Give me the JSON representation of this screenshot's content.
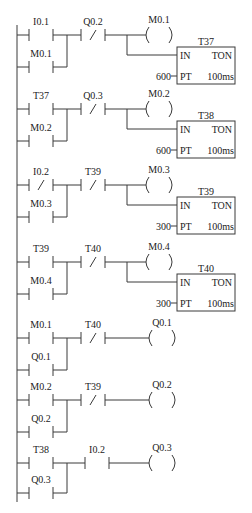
{
  "diagram": {
    "type": "plc-ladder-diagram",
    "rail": {
      "x": 17,
      "y_top": 25,
      "y_bottom": 502
    },
    "rungs": [
      {
        "id": 1,
        "y": 35,
        "contacts": [
          {
            "label": "I0.1",
            "type": "NO",
            "x": 29,
            "branch": "main"
          },
          {
            "label": "M0.1",
            "type": "NO",
            "x": 29,
            "branch": "parallel",
            "y": 67
          },
          {
            "label": "Q0.2",
            "type": "NC",
            "x": 81
          }
        ],
        "coil": {
          "label": "M0.1",
          "x": 145
        },
        "timer": {
          "name": "T37",
          "in": "IN",
          "type": "TON",
          "pt_label": "PT",
          "pt_value": "600",
          "base": "100ms",
          "y": 47
        }
      },
      {
        "id": 2,
        "y": 109,
        "contacts": [
          {
            "label": "T37",
            "type": "NO",
            "x": 29,
            "branch": "main"
          },
          {
            "label": "M0.2",
            "type": "NO",
            "x": 29,
            "branch": "parallel",
            "y": 141
          },
          {
            "label": "Q0.3",
            "type": "NC",
            "x": 81
          }
        ],
        "coil": {
          "label": "M0.2",
          "x": 145
        },
        "timer": {
          "name": "T38",
          "in": "IN",
          "type": "TON",
          "pt_label": "PT",
          "pt_value": "600",
          "base": "100ms",
          "y": 121
        }
      },
      {
        "id": 3,
        "y": 185,
        "contacts": [
          {
            "label": "I0.2",
            "type": "NC",
            "x": 29,
            "branch": "main"
          },
          {
            "label": "M0.3",
            "type": "NO",
            "x": 29,
            "branch": "parallel",
            "y": 217
          },
          {
            "label": "T39",
            "type": "NC",
            "x": 81
          }
        ],
        "coil": {
          "label": "M0.3",
          "x": 145
        },
        "timer": {
          "name": "T39",
          "in": "IN",
          "type": "TON",
          "pt_label": "PT",
          "pt_value": "300",
          "base": "100ms",
          "y": 197
        }
      },
      {
        "id": 4,
        "y": 262,
        "contacts": [
          {
            "label": "T39",
            "type": "NO",
            "x": 29,
            "branch": "main"
          },
          {
            "label": "M0.4",
            "type": "NO",
            "x": 29,
            "branch": "parallel",
            "y": 294
          },
          {
            "label": "T40",
            "type": "NC",
            "x": 81
          }
        ],
        "coil": {
          "label": "M0.4",
          "x": 145
        },
        "timer": {
          "name": "T40",
          "in": "IN",
          "type": "TON",
          "pt_label": "PT",
          "pt_value": "300",
          "base": "100ms",
          "y": 274
        }
      },
      {
        "id": 5,
        "y": 338,
        "contacts": [
          {
            "label": "M0.1",
            "type": "NO",
            "x": 29,
            "branch": "main"
          },
          {
            "label": "Q0.1",
            "type": "NO",
            "x": 29,
            "branch": "parallel",
            "y": 370
          },
          {
            "label": "T40",
            "type": "NC",
            "x": 81
          }
        ],
        "coil": {
          "label": "Q0.1",
          "x": 148
        }
      },
      {
        "id": 6,
        "y": 400,
        "contacts": [
          {
            "label": "M0.2",
            "type": "NO",
            "x": 29,
            "branch": "main"
          },
          {
            "label": "Q0.2",
            "type": "NO",
            "x": 29,
            "branch": "parallel",
            "y": 432
          },
          {
            "label": "T39",
            "type": "NC",
            "x": 81
          }
        ],
        "coil": {
          "label": "Q0.2",
          "x": 148
        }
      },
      {
        "id": 7,
        "y": 463,
        "contacts": [
          {
            "label": "T38",
            "type": "NO",
            "x": 29,
            "branch": "main"
          },
          {
            "label": "Q0.3",
            "type": "NO",
            "x": 29,
            "branch": "parallel",
            "y": 493
          },
          {
            "label": "I0.2",
            "type": "NO",
            "x": 85
          }
        ],
        "coil": {
          "label": "Q0.3",
          "x": 148
        }
      }
    ]
  }
}
